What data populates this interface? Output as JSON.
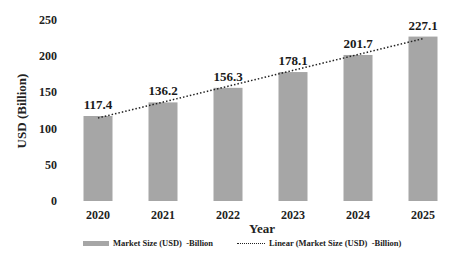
{
  "chart_data": {
    "type": "bar",
    "title": "",
    "xlabel": "Year",
    "ylabel": "USD (Billion)",
    "categories": [
      "2020",
      "2021",
      "2022",
      "2023",
      "2024",
      "2025"
    ],
    "series": [
      {
        "name": "Market Size (USD)  -Billion",
        "type": "bar",
        "color": "#a6a6a6",
        "values": [
          117.4,
          136.2,
          156.3,
          178.1,
          201.7,
          227.1
        ]
      },
      {
        "name": "Linear (Market Size (USD)  -Billion)",
        "type": "line",
        "style": "dotted",
        "color": "#222222"
      }
    ],
    "data_labels": [
      "117.4",
      "136.2",
      "156.3",
      "178.1",
      "201.7",
      "227.1"
    ],
    "yticks": [
      0,
      50,
      100,
      150,
      200,
      250
    ],
    "ylim": [
      0,
      250
    ],
    "grid": false,
    "legend_position": "bottom"
  },
  "legend": {
    "bar_label": "Market Size (USD)  -Billion",
    "line_label": "Linear (Market Size (USD)  -Billion)"
  },
  "axes": {
    "x_title": "Year",
    "y_title": "USD (Billion)"
  }
}
